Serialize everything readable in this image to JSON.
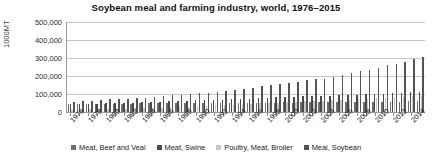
{
  "chart_data": {
    "type": "bar",
    "title": "Soybean meal and farming industry, world, 1976–2015",
    "xlabel": "",
    "ylabel": "1000MT",
    "ylim": [
      0,
      500000
    ],
    "yticks": [
      500000,
      400000,
      300000,
      200000,
      100000,
      0
    ],
    "ytick_labels": [
      "500,000",
      "400,000",
      "300,000",
      "200,000",
      "100,000",
      "0"
    ],
    "grid": true,
    "legend_position": "bottom",
    "categories": [
      "1976",
      "1977",
      "1978",
      "1979",
      "1980",
      "1981",
      "1982",
      "1983",
      "1984",
      "1985",
      "1986",
      "1987",
      "1988",
      "1989",
      "1990",
      "1991",
      "1992",
      "1993",
      "1994",
      "1995",
      "1996",
      "1997",
      "1998",
      "1999",
      "2000",
      "2001",
      "2002",
      "2003",
      "2004",
      "2005",
      "2006",
      "2007",
      "2008",
      "2009",
      "2010",
      "2011",
      "2012",
      "2013",
      "2014",
      "2015"
    ],
    "xtick_labels": [
      "1976",
      "1978",
      "1980",
      "1982",
      "1984",
      "1986",
      "1988",
      "1990",
      "1992",
      "1994",
      "1996",
      "1998",
      "2000",
      "2002",
      "2004",
      "2006",
      "2008",
      "2010",
      "2012",
      "2014"
    ],
    "series": [
      {
        "name": "Meat, Beef and Veal",
        "color": "#6e6e6e",
        "values": [
          45000,
          45500,
          45800,
          46500,
          45900,
          45800,
          46200,
          46800,
          47500,
          48200,
          48800,
          49500,
          50100,
          50000,
          50500,
          50200,
          50300,
          50100,
          50600,
          51000,
          51200,
          51400,
          52000,
          52500,
          53000,
          52800,
          53500,
          53800,
          54200,
          55000,
          55800,
          56500,
          57000,
          56800,
          57200,
          57000,
          57500,
          58000,
          58800,
          58500
        ]
      },
      {
        "name": "Meat, Swine",
        "color": "#4a4a4a",
        "values": [
          42000,
          43500,
          45000,
          47000,
          48500,
          49500,
          50500,
          52000,
          53500,
          55500,
          57500,
          59000,
          61000,
          62500,
          64000,
          65500,
          66500,
          68000,
          70500,
          73000,
          74000,
          76000,
          79000,
          81000,
          82500,
          84000,
          86500,
          88500,
          89500,
          91500,
          94000,
          93500,
          95500,
          98500,
          101000,
          101500,
          104500,
          107000,
          110000,
          109500
        ]
      },
      {
        "name": "Poultry, Meat, Broiler",
        "color": "#c6c6c6",
        "values": [
          13000,
          14000,
          15000,
          16500,
          17500,
          18500,
          19500,
          20500,
          22000,
          23500,
          25000,
          26500,
          28500,
          30000,
          32000,
          34000,
          36500,
          39000,
          41500,
          44000,
          46000,
          47500,
          50000,
          52500,
          54000,
          56000,
          58500,
          59500,
          61000,
          64000,
          66500,
          69500,
          72500,
          74500,
          77500,
          80500,
          83000,
          85000,
          87500,
          89000
        ]
      },
      {
        "name": "Meal, Soybean",
        "color": "#545454",
        "values": [
          56000,
          60000,
          63000,
          68000,
          70000,
          72000,
          75000,
          76000,
          79000,
          83000,
          88000,
          92000,
          96000,
          99000,
          103000,
          107000,
          113000,
          116000,
          122000,
          130000,
          136000,
          143000,
          152000,
          158000,
          162000,
          168000,
          177000,
          182000,
          186000,
          196000,
          205000,
          217000,
          227000,
          234000,
          245000,
          260000,
          268000,
          280000,
          295000,
          305000
        ]
      }
    ]
  }
}
